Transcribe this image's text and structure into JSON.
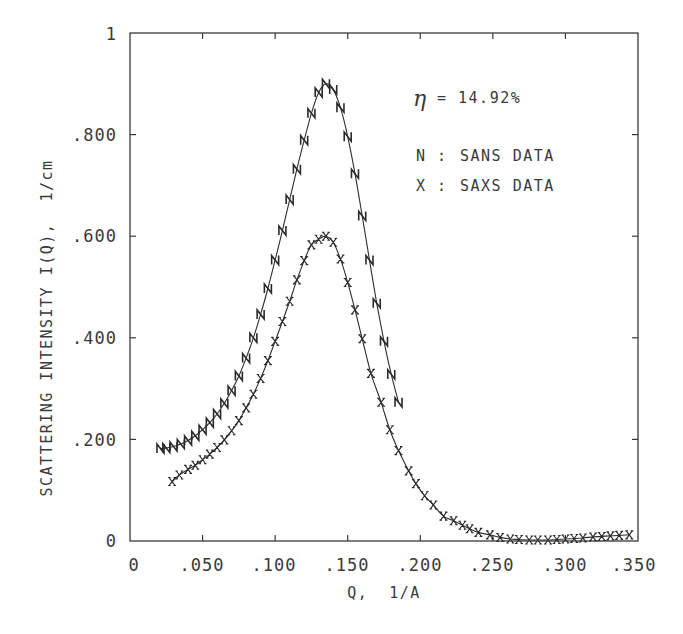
{
  "chart_data": {
    "type": "scatter",
    "title": "",
    "xlabel": "Q, 1/A",
    "ylabel": "SCATTERING INTENSITY I(Q), 1/cm",
    "xlim": [
      0,
      0.35
    ],
    "ylim": [
      0,
      1
    ],
    "grid": false,
    "x_ticks": [
      0,
      0.05,
      0.1,
      0.15,
      0.2,
      0.25,
      0.3,
      0.35
    ],
    "x_tick_labels": [
      "0",
      ".050",
      ".100",
      ".150",
      ".200",
      ".250",
      ".300",
      ".350"
    ],
    "y_ticks": [
      0,
      0.2,
      0.4,
      0.6,
      0.8,
      1.0
    ],
    "y_tick_labels": [
      "0",
      ".200",
      ".400",
      ".600",
      ".800",
      "1"
    ],
    "annotations": [
      {
        "text": "η = 14.92%",
        "x": 0.19,
        "y": 0.86
      }
    ],
    "legend": {
      "position": "upper right",
      "entries": [
        {
          "marker": "N",
          "label": "SANS DATA"
        },
        {
          "marker": "X",
          "label": "SAXS DATA"
        }
      ]
    },
    "series": [
      {
        "name": "SANS DATA",
        "marker": "N",
        "with_fit_line": true,
        "x": [
          0.021,
          0.025,
          0.03,
          0.035,
          0.04,
          0.045,
          0.05,
          0.055,
          0.06,
          0.065,
          0.07,
          0.075,
          0.08,
          0.085,
          0.09,
          0.095,
          0.1,
          0.105,
          0.11,
          0.115,
          0.12,
          0.125,
          0.13,
          0.135,
          0.14,
          0.145,
          0.15,
          0.155,
          0.16,
          0.165,
          0.17,
          0.175,
          0.18,
          0.185
        ],
        "y": [
          0.182,
          0.183,
          0.186,
          0.191,
          0.198,
          0.207,
          0.219,
          0.233,
          0.25,
          0.271,
          0.296,
          0.325,
          0.36,
          0.4,
          0.446,
          0.497,
          0.553,
          0.611,
          0.672,
          0.732,
          0.789,
          0.842,
          0.883,
          0.9,
          0.889,
          0.853,
          0.796,
          0.723,
          0.64,
          0.553,
          0.468,
          0.393,
          0.328,
          0.273
        ]
      },
      {
        "name": "SAXS DATA",
        "marker": "X",
        "with_fit_line": true,
        "x": [
          0.029,
          0.034,
          0.04,
          0.045,
          0.05,
          0.055,
          0.06,
          0.065,
          0.07,
          0.075,
          0.08,
          0.085,
          0.09,
          0.095,
          0.1,
          0.105,
          0.11,
          0.115,
          0.12,
          0.125,
          0.13,
          0.135,
          0.14,
          0.145,
          0.15,
          0.155,
          0.16,
          0.166,
          0.173,
          0.179,
          0.185,
          0.192,
          0.197,
          0.203,
          0.209,
          0.216,
          0.223,
          0.229,
          0.234,
          0.24,
          0.248,
          0.255,
          0.262,
          0.268,
          0.275,
          0.281,
          0.288,
          0.294,
          0.3,
          0.306,
          0.312,
          0.319,
          0.325,
          0.331,
          0.337,
          0.344
        ],
        "y": [
          0.117,
          0.13,
          0.141,
          0.149,
          0.16,
          0.171,
          0.184,
          0.199,
          0.217,
          0.237,
          0.262,
          0.289,
          0.32,
          0.355,
          0.393,
          0.432,
          0.472,
          0.514,
          0.552,
          0.583,
          0.594,
          0.6,
          0.588,
          0.555,
          0.509,
          0.455,
          0.398,
          0.33,
          0.273,
          0.219,
          0.178,
          0.138,
          0.113,
          0.089,
          0.071,
          0.049,
          0.04,
          0.031,
          0.024,
          0.017,
          0.012,
          0.007,
          0.004,
          0.003,
          0.002,
          0.002,
          0.002,
          0.003,
          0.004,
          0.005,
          0.006,
          0.008,
          0.009,
          0.01,
          0.011,
          0.012
        ]
      }
    ]
  },
  "annotation": {
    "eta_symbol": "η",
    "eta_text": "= 14.92%"
  },
  "legend": {
    "sans_marker": "N",
    "sans_sep": ":",
    "sans_label": "SANS DATA",
    "saxs_marker": "X",
    "saxs_sep": ":",
    "saxs_label": "SAXS DATA"
  },
  "axes": {
    "xlabel": "Q,  1/A",
    "ylabel": "SCATTERING INTENSITY I(Q),  1/cm",
    "x_tick_labels": [
      "0",
      ".050",
      ".100",
      ".150",
      ".200",
      ".250",
      ".300",
      ".350"
    ],
    "y_tick_labels": [
      "0",
      ".200",
      ".400",
      ".600",
      ".800",
      "1"
    ]
  }
}
